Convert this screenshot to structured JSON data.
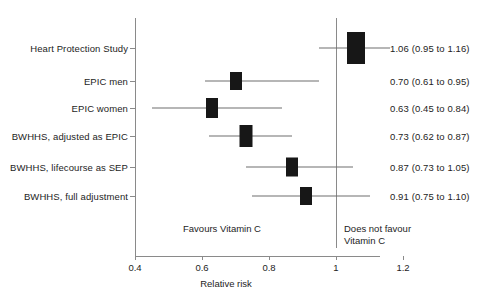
{
  "chart_data": {
    "type": "scatter",
    "subtype": "forest-plot",
    "title": "",
    "xlabel": "Relative risk",
    "ylabel": "",
    "xlim": [
      0.4,
      1.2
    ],
    "xticks": [
      0.4,
      0.6,
      0.8,
      1.0,
      1.2
    ],
    "xtick_labels": [
      "0.4",
      "0.6",
      "0.8",
      "1",
      "1.2"
    ],
    "grid": false,
    "legend": "none",
    "reference_line": 1.0,
    "x_scale": "linear",
    "categories": [
      "Heart Protection Study",
      "EPIC men",
      "EPIC women",
      "BWHHS, adjusted as EPIC",
      "BWHHS, lifecourse as SEP",
      "BWHHS, full adjustment"
    ],
    "values": [
      1.06,
      0.7,
      0.63,
      0.73,
      0.87,
      0.91
    ],
    "ci_low": [
      0.95,
      0.61,
      0.45,
      0.62,
      0.73,
      0.75
    ],
    "ci_high": [
      1.16,
      0.95,
      0.84,
      0.87,
      1.05,
      1.1
    ],
    "marker_weights": [
      1.0,
      0.5,
      0.55,
      0.62,
      0.52,
      0.5
    ],
    "rows": [
      {
        "label": "Heart Protection Study",
        "estimate": 1.06,
        "ci_low": 0.95,
        "ci_high": 1.16,
        "value_text": "1.06 (0.95 to 1.16)",
        "box_w": 18,
        "box_h": 32,
        "y": 48
      },
      {
        "label": "EPIC men",
        "estimate": 0.7,
        "ci_low": 0.61,
        "ci_high": 0.95,
        "value_text": "0.70 (0.61 to 0.95)",
        "box_w": 12,
        "box_h": 18,
        "y": 81
      },
      {
        "label": "EPIC women",
        "estimate": 0.63,
        "ci_low": 0.45,
        "ci_high": 0.84,
        "value_text": "0.63 (0.45 to 0.84)",
        "box_w": 12,
        "box_h": 20,
        "y": 108
      },
      {
        "label": "BWHHS, adjusted as EPIC",
        "estimate": 0.73,
        "ci_low": 0.62,
        "ci_high": 0.87,
        "value_text": "0.73 (0.62 to 0.87)",
        "box_w": 13,
        "box_h": 22,
        "y": 136
      },
      {
        "label": "BWHHS, lifecourse as SEP",
        "estimate": 0.87,
        "ci_low": 0.73,
        "ci_high": 1.05,
        "value_text": "0.87 (0.73 to 1.05)",
        "box_w": 12,
        "box_h": 19,
        "y": 167
      },
      {
        "label": "BWHHS, full adjustment",
        "estimate": 0.91,
        "ci_low": 0.75,
        "ci_high": 1.1,
        "value_text": "0.91 (0.75 to 1.10)",
        "box_w": 12,
        "box_h": 18,
        "y": 196
      }
    ],
    "annotations": {
      "favours_left": "Favours Vitamin C",
      "favours_right_line1": "Does not favour",
      "favours_right_line2": "Vitamin C"
    }
  }
}
